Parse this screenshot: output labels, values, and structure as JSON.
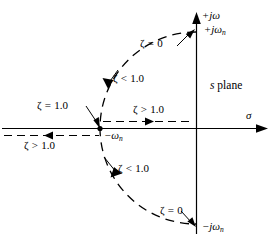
{
  "figure": {
    "name": "s-plane root locus diagram",
    "domain": "diagram",
    "plane_label": {
      "symbol": "s",
      "word": "plane"
    },
    "axes": {
      "real": {
        "symbol": "σ",
        "name": "sigma-axis",
        "direction": "right"
      },
      "imaginary": {
        "symbol": "+jω",
        "name": "j-omega-axis",
        "direction": "up"
      }
    },
    "points": [
      {
        "id": "pos-jwn",
        "label_prefix": "+jω",
        "label_sub": "n",
        "x": 196,
        "y": 30
      },
      {
        "id": "neg-jwn",
        "label_prefix": "−jω",
        "label_sub": "n",
        "x": 196,
        "y": 226
      },
      {
        "id": "breakaway",
        "label_prefix": "−ω",
        "label_sub": "n",
        "x": 100,
        "y": 128
      }
    ],
    "annotations": [
      {
        "id": "zeta-eq-0-top",
        "zeta": "ζ",
        "op": "=",
        "value": "0"
      },
      {
        "id": "zeta-lt-1-upper",
        "zeta": "ζ",
        "op": "<",
        "value": "1.0"
      },
      {
        "id": "zeta-eq-1",
        "zeta": "ζ",
        "op": "=",
        "value": "1.0"
      },
      {
        "id": "zeta-gt-1-upper",
        "zeta": "ζ",
        "op": ">",
        "value": "1.0"
      },
      {
        "id": "zeta-gt-1-lower",
        "zeta": "ζ",
        "op": ">",
        "value": "1.0"
      },
      {
        "id": "zeta-lt-1-lower",
        "zeta": "ζ",
        "op": "<",
        "value": "1.0"
      },
      {
        "id": "zeta-eq-0-bottom",
        "zeta": "ζ",
        "op": "=",
        "value": "0"
      }
    ],
    "geometry": {
      "origin_x": 196,
      "origin_y": 128,
      "radius": 96,
      "stroke": "#000000"
    }
  }
}
